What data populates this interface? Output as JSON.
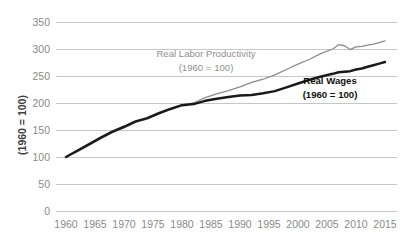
{
  "chart_data": {
    "type": "line",
    "title": "",
    "xlabel": "",
    "ylabel": "(1960 = 100)",
    "xlim": [
      1960,
      2015
    ],
    "ylim": [
      0,
      350
    ],
    "grid": true,
    "legend_position": "inline-annotations",
    "yticks": [
      0,
      50,
      100,
      150,
      200,
      250,
      300,
      350
    ],
    "xticks": [
      1960,
      1965,
      1970,
      1975,
      1980,
      1985,
      1990,
      1995,
      2000,
      2005,
      2010,
      2015
    ],
    "x": [
      1960,
      1962,
      1964,
      1966,
      1968,
      1970,
      1972,
      1974,
      1976,
      1978,
      1980,
      1982,
      1984,
      1986,
      1988,
      1990,
      1992,
      1994,
      1996,
      1998,
      2000,
      2002,
      2004,
      2006,
      2007,
      2008,
      2009,
      2010,
      2011,
      2012,
      2013,
      2014,
      2015
    ],
    "series": [
      {
        "name": "Real Labor Productivity",
        "color": "#8c8c8c",
        "style": "thin-gray",
        "values": [
          100,
          110,
          122,
          134,
          145,
          154,
          164,
          170,
          180,
          188,
          196,
          200,
          210,
          217,
          223,
          230,
          238,
          244,
          252,
          262,
          272,
          281,
          292,
          300,
          308,
          306,
          299,
          304,
          305,
          307,
          309,
          312,
          315
        ]
      },
      {
        "name": "Real Wages",
        "color": "#1a1a1a",
        "style": "thick-black",
        "values": [
          100,
          112,
          124,
          136,
          147,
          156,
          166,
          172,
          181,
          189,
          196,
          198,
          204,
          208,
          211,
          214,
          215,
          218,
          222,
          229,
          236,
          243,
          249,
          254,
          257,
          258,
          259,
          262,
          264,
          267,
          270,
          273,
          276
        ]
      }
    ],
    "annotations": [
      {
        "id": "productivity-label",
        "line1": "Real Labor Productivity",
        "line2": "(1960 = 100)",
        "color": "#8f8f8f",
        "x": 206,
        "y": 57
      },
      {
        "id": "wages-label",
        "line1": "Real Wages",
        "line2": "(1960 = 100)",
        "color": "#111111",
        "x": 330,
        "y": 84
      }
    ]
  },
  "axis": {
    "y_title": "(1960 = 100)",
    "y_labels": [
      "350",
      "300",
      "250",
      "200",
      "150",
      "100",
      "50",
      "0"
    ],
    "x_labels": [
      "1960",
      "1965",
      "1970",
      "1975",
      "1980",
      "1985",
      "1990",
      "1995",
      "2000",
      "2005",
      "2010",
      "2015"
    ]
  },
  "annotations": {
    "productivity": {
      "line1": "Real Labor Productivity",
      "line2": "(1960 = 100)"
    },
    "wages": {
      "line1": "Real Wages",
      "line2": "(1960 = 100)"
    }
  },
  "colors": {
    "productivity_line": "#8c8c8c",
    "wages_line": "#1a1a1a",
    "gridline": "#b8b8b8",
    "tick_text": "#8a8a8a",
    "background": "#ffffff"
  }
}
